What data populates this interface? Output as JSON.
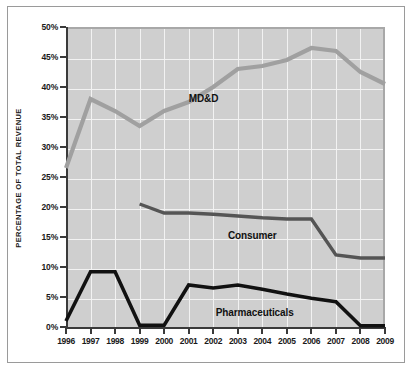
{
  "chart_data": {
    "type": "line",
    "title": "",
    "xlabel": "",
    "ylabel": "PERCENTAGE OF TOTAL REVENUE",
    "xlim": [
      1996,
      2009
    ],
    "ylim": [
      0,
      50
    ],
    "grid": true,
    "legend_position": "inline-annotations",
    "categories": [
      "1996",
      "1997",
      "1998",
      "1999",
      "2000",
      "2001",
      "2002",
      "2003",
      "2004",
      "2005",
      "2006",
      "2007",
      "2008",
      "2009"
    ],
    "ytick_labels": [
      "0%",
      "5%",
      "10%",
      "15%",
      "20%",
      "25%",
      "30%",
      "35%",
      "40%",
      "45%",
      "50%"
    ],
    "ytick_values": [
      0,
      5,
      10,
      15,
      20,
      25,
      30,
      35,
      40,
      45,
      50
    ],
    "series": [
      {
        "name": "MD&D",
        "color": "#a0a0a0",
        "x": [
          1996,
          1997,
          1998,
          1999,
          2000,
          2001,
          2002,
          2003,
          2004,
          2005,
          2006,
          2007,
          2008,
          2009
        ],
        "values": [
          26.5,
          38.0,
          36.0,
          33.5,
          36.0,
          37.5,
          40.0,
          43.0,
          43.5,
          44.5,
          46.5,
          46.0,
          42.5,
          40.5
        ]
      },
      {
        "name": "Consumer",
        "color": "#555555",
        "x": [
          1999,
          2000,
          2001,
          2002,
          2003,
          2004,
          2005,
          2006,
          2007,
          2008,
          2009
        ],
        "values": [
          20.5,
          19.0,
          19.0,
          18.8,
          18.5,
          18.2,
          18.0,
          18.0,
          12.0,
          11.5,
          11.5
        ]
      },
      {
        "name": "Pharmaceuticals",
        "color": "#111111",
        "x": [
          1996,
          1997,
          1998,
          1999,
          2000,
          2001,
          2002,
          2003,
          2004,
          2005,
          2006,
          2007,
          2008,
          2009
        ],
        "values": [
          1.0,
          9.2,
          9.2,
          0.3,
          0.3,
          7.0,
          6.5,
          7.0,
          6.3,
          5.5,
          4.8,
          4.2,
          0.2,
          0.2
        ]
      }
    ],
    "annotations": [
      {
        "text": "MD&D",
        "x": 2001.0,
        "y": 38.0
      },
      {
        "text": "Consumer",
        "x": 2002.6,
        "y": 15.2
      },
      {
        "text": "Pharmaceuticals",
        "x": 2002.1,
        "y": 2.4
      }
    ]
  }
}
